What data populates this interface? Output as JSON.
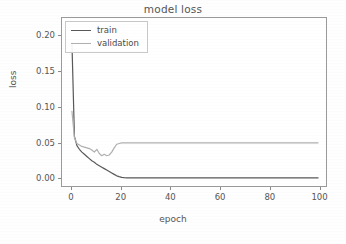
{
  "chart_data": {
    "type": "line",
    "title": "model loss",
    "xlabel": "epoch",
    "ylabel": "loss",
    "xlim": [
      -4,
      103
    ],
    "ylim": [
      -0.012,
      0.225
    ],
    "grid": false,
    "legend_position": "upper left",
    "xticks": [
      0,
      20,
      40,
      60,
      80,
      100
    ],
    "xtick_labels": [
      "0",
      "20",
      "40",
      "60",
      "80",
      "100"
    ],
    "yticks": [
      0.0,
      0.05,
      0.1,
      0.15,
      0.2
    ],
    "ytick_labels": [
      "0.00",
      "0.05",
      "0.10",
      "0.15",
      "0.20"
    ],
    "series": [
      {
        "name": "train",
        "color": "#595959",
        "x": [
          0,
          1,
          2,
          3,
          4,
          5,
          6,
          7,
          8,
          9,
          10,
          11,
          12,
          13,
          14,
          15,
          16,
          17,
          18,
          19,
          20,
          21,
          22,
          23,
          24,
          25,
          30,
          35,
          40,
          45,
          50,
          55,
          60,
          65,
          70,
          75,
          80,
          85,
          90,
          95,
          99
        ],
        "values": [
          0.19,
          0.06,
          0.047,
          0.042,
          0.038,
          0.035,
          0.032,
          0.029,
          0.026,
          0.024,
          0.021,
          0.019,
          0.017,
          0.015,
          0.013,
          0.011,
          0.009,
          0.007,
          0.005,
          0.0038,
          0.0029,
          0.0024,
          0.0022,
          0.0021,
          0.002,
          0.002,
          0.002,
          0.002,
          0.002,
          0.002,
          0.002,
          0.002,
          0.002,
          0.002,
          0.002,
          0.002,
          0.002,
          0.002,
          0.002,
          0.002,
          0.002
        ]
      },
      {
        "name": "validation",
        "color": "#b0b0b0",
        "x": [
          0,
          1,
          2,
          3,
          4,
          5,
          6,
          7,
          8,
          9,
          10,
          11,
          12,
          13,
          14,
          15,
          16,
          17,
          18,
          19,
          20,
          21,
          22,
          25,
          30,
          35,
          40,
          45,
          50,
          55,
          60,
          65,
          70,
          75,
          80,
          85,
          90,
          95,
          99
        ],
        "values": [
          0.095,
          0.058,
          0.05,
          0.048,
          0.046,
          0.045,
          0.044,
          0.043,
          0.041,
          0.038,
          0.042,
          0.036,
          0.033,
          0.035,
          0.033,
          0.034,
          0.038,
          0.044,
          0.049,
          0.05,
          0.0508,
          0.051,
          0.051,
          0.051,
          0.051,
          0.051,
          0.051,
          0.051,
          0.051,
          0.051,
          0.051,
          0.051,
          0.051,
          0.051,
          0.051,
          0.051,
          0.051,
          0.051,
          0.051
        ]
      }
    ]
  },
  "legend": {
    "entries": [
      {
        "label": "train",
        "color": "#595959"
      },
      {
        "label": "validation",
        "color": "#b0b0b0"
      }
    ]
  }
}
